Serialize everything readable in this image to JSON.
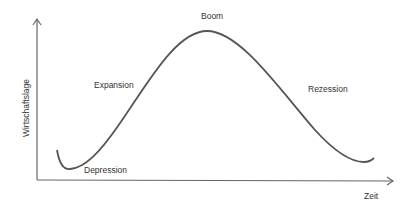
{
  "diagram": {
    "y_axis_label": "Wirtschaftslage",
    "x_axis_label": "Zeit",
    "phases": [
      {
        "label": "Depression"
      },
      {
        "label": "Expansion"
      },
      {
        "label": "Boom"
      },
      {
        "label": "Rezession"
      }
    ],
    "colors": {
      "line": "#555555",
      "axis": "#666666",
      "text": "#333333"
    }
  }
}
